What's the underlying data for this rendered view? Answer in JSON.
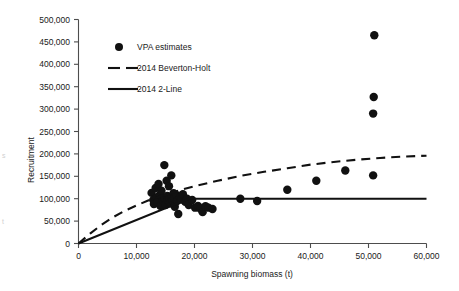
{
  "chart_data": {
    "type": "scatter",
    "title": "",
    "xlabel": "Spawning biomass (t)",
    "ylabel": "Recruitment",
    "xlim": [
      0,
      60000
    ],
    "ylim": [
      0,
      500000
    ],
    "grid": false,
    "legend_position": "top-left",
    "xticks": [
      0,
      10000,
      20000,
      30000,
      40000,
      50000,
      60000
    ],
    "xticklabels": [
      "0",
      "10,000",
      "20,000",
      "30,000",
      "40,000",
      "50,000",
      "60,000"
    ],
    "yticks": [
      0,
      50000,
      100000,
      150000,
      200000,
      250000,
      300000,
      350000,
      400000,
      450000,
      500000
    ],
    "yticklabels": [
      "0",
      "50,000",
      "100,000",
      "150,000",
      "200,000",
      "250,000",
      "300,000",
      "350,000",
      "400,000",
      "450,000",
      "500,000"
    ],
    "series": [
      {
        "name": "VPA estimates",
        "type": "scatter",
        "marker": "filled-circle",
        "color": "#111111",
        "points": [
          [
            12600,
            113000
          ],
          [
            12900,
            97000
          ],
          [
            13000,
            88000
          ],
          [
            13300,
            124000
          ],
          [
            13500,
            103000
          ],
          [
            13600,
            92000
          ],
          [
            13800,
            133000
          ],
          [
            14000,
            108000
          ],
          [
            14100,
            84000
          ],
          [
            14300,
            118000
          ],
          [
            14500,
            101000
          ],
          [
            14600,
            95000
          ],
          [
            14800,
            175000
          ],
          [
            14900,
            100000
          ],
          [
            15000,
            86000
          ],
          [
            15200,
            140000
          ],
          [
            15300,
            106000
          ],
          [
            15400,
            97000
          ],
          [
            15600,
            128000
          ],
          [
            15700,
            99000
          ],
          [
            15800,
            90000
          ],
          [
            16000,
            152000
          ],
          [
            16100,
            104000
          ],
          [
            16200,
            96000
          ],
          [
            16400,
            112000
          ],
          [
            16500,
            100000
          ],
          [
            16600,
            82000
          ],
          [
            16900,
            108000
          ],
          [
            17000,
            95000
          ],
          [
            17200,
            66000
          ],
          [
            17500,
            103000
          ],
          [
            17700,
            98000
          ],
          [
            18000,
            110000
          ],
          [
            18400,
            93000
          ],
          [
            18700,
            100000
          ],
          [
            19000,
            86000
          ],
          [
            19600,
            97000
          ],
          [
            20100,
            80000
          ],
          [
            20600,
            84000
          ],
          [
            21000,
            78000
          ],
          [
            21400,
            70000
          ],
          [
            21900,
            83000
          ],
          [
            22400,
            80000
          ],
          [
            23100,
            77000
          ],
          [
            27900,
            100000
          ],
          [
            30800,
            95000
          ],
          [
            36000,
            120000
          ],
          [
            41000,
            140000
          ],
          [
            46000,
            163000
          ],
          [
            50800,
            152000
          ],
          [
            50800,
            290000
          ],
          [
            50900,
            327000
          ],
          [
            51000,
            465000
          ]
        ]
      },
      {
        "name": "2014 Beverton-Holt",
        "type": "line",
        "style": "dashed",
        "color": "#111111",
        "points": [
          [
            0,
            0
          ],
          [
            2000,
            22000
          ],
          [
            4000,
            42000
          ],
          [
            6000,
            59000
          ],
          [
            8000,
            73000
          ],
          [
            10000,
            85000
          ],
          [
            12000,
            96000
          ],
          [
            14000,
            105000
          ],
          [
            16000,
            113000
          ],
          [
            18000,
            121000
          ],
          [
            20000,
            128000
          ],
          [
            24000,
            140000
          ],
          [
            28000,
            151000
          ],
          [
            32000,
            160000
          ],
          [
            36000,
            168000
          ],
          [
            40000,
            176000
          ],
          [
            44000,
            182000
          ],
          [
            48000,
            187000
          ],
          [
            52000,
            191000
          ],
          [
            56000,
            194000
          ],
          [
            60000,
            196000
          ]
        ]
      },
      {
        "name": "2014 2-Line",
        "type": "line",
        "style": "solid",
        "color": "#111111",
        "breakpoint": [
          19000,
          100000
        ],
        "points": [
          [
            0,
            0
          ],
          [
            19000,
            100000
          ],
          [
            60000,
            100000
          ]
        ]
      }
    ]
  },
  "legend": {
    "items": [
      {
        "label": "VPA estimates",
        "marker": "filled-circle"
      },
      {
        "label": "2014 Beverton-Holt",
        "marker": "dashed-line"
      },
      {
        "label": "2014 2-Line",
        "marker": "solid-line"
      }
    ]
  },
  "axes": {
    "x_title": "Spawning biomass (t)",
    "y_title": "Recruitment"
  }
}
